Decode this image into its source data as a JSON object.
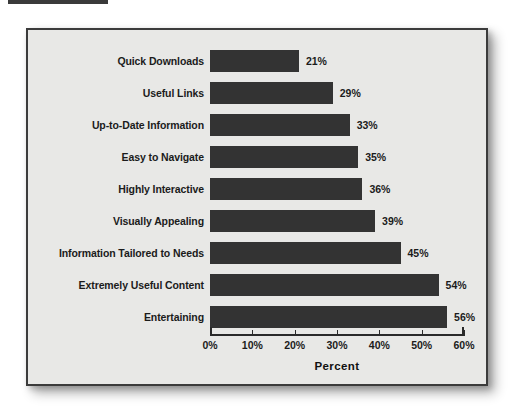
{
  "chart_data": {
    "type": "bar",
    "orientation": "horizontal",
    "title": "",
    "xlabel": "Percent",
    "ylabel": "",
    "xlim": [
      0,
      60
    ],
    "grid": false,
    "legend": null,
    "tick_labels": [
      "0%",
      "10%",
      "20%",
      "30%",
      "40%",
      "50%",
      "60%"
    ],
    "tick_values": [
      0,
      10,
      20,
      30,
      40,
      50,
      60
    ],
    "categories": [
      "Quick Downloads",
      "Useful Links",
      "Up-to-Date Information",
      "Easy to Navigate",
      "Highly Interactive",
      "Visually Appealing",
      "Information Tailored to Needs",
      "Extremely Useful Content",
      "Entertaining"
    ],
    "values": [
      21,
      29,
      33,
      35,
      36,
      39,
      45,
      54,
      56
    ],
    "value_labels": [
      "21%",
      "29%",
      "33%",
      "35%",
      "36%",
      "39%",
      "45%",
      "54%",
      "56%"
    ],
    "bar_color": "#333333",
    "plot_background": "#e8e8e6",
    "frame_color": "#3b3b3b",
    "text_color": "#1b1b1b"
  }
}
